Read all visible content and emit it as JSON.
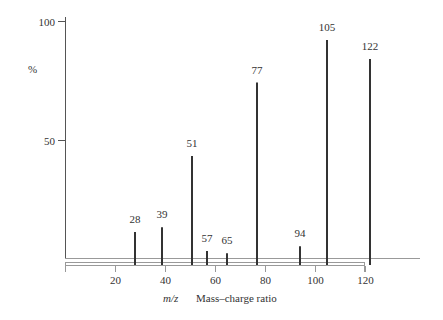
{
  "chart_data": {
    "type": "bar",
    "title": "",
    "xlabel_symbol": "m/z",
    "xlabel": "Mass–charge ratio",
    "ylabel": "%",
    "xlim": [
      0,
      140
    ],
    "ylim": [
      0,
      100
    ],
    "x_ticks": [
      20,
      40,
      60,
      80,
      100,
      120
    ],
    "y_ticks": [
      50,
      100
    ],
    "grid": false,
    "legend": "none",
    "peaks": [
      {
        "mz": 28,
        "label": "28",
        "intensity": 11
      },
      {
        "mz": 39,
        "label": "39",
        "intensity": 13
      },
      {
        "mz": 51,
        "label": "51",
        "intensity": 43
      },
      {
        "mz": 57,
        "label": "57",
        "intensity": 3
      },
      {
        "mz": 65,
        "label": "65",
        "intensity": 2
      },
      {
        "mz": 77,
        "label": "77",
        "intensity": 74
      },
      {
        "mz": 94,
        "label": "94",
        "intensity": 5
      },
      {
        "mz": 105,
        "label": "105",
        "intensity": 92
      },
      {
        "mz": 122,
        "label": "122",
        "intensity": 84
      }
    ]
  }
}
